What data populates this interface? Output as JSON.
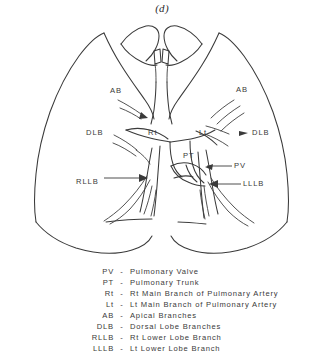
{
  "figure": {
    "caption": "(d)"
  },
  "diagram_labels": [
    {
      "id": "ab-left",
      "text": "AB",
      "x": 110,
      "y": 87
    },
    {
      "id": "ab-right",
      "text": "AB",
      "x": 236,
      "y": 86
    },
    {
      "id": "dlb-left",
      "text": "DLB",
      "x": 86,
      "y": 129
    },
    {
      "id": "dlb-right",
      "text": "DLB",
      "x": 252,
      "y": 129
    },
    {
      "id": "rt",
      "text": "Rt",
      "x": 148,
      "y": 129
    },
    {
      "id": "lt",
      "text": "Lt",
      "x": 199,
      "y": 129
    },
    {
      "id": "pt",
      "text": "PT",
      "x": 183,
      "y": 152
    },
    {
      "id": "pv",
      "text": "PV",
      "x": 234,
      "y": 162
    },
    {
      "id": "rllb",
      "text": "RLLB",
      "x": 76,
      "y": 178
    },
    {
      "id": "lllb",
      "text": "LLLB",
      "x": 243,
      "y": 180
    }
  ],
  "legend": {
    "dash": "-",
    "entries": [
      {
        "abbr": "PV",
        "desc": "Pulmonary Valve"
      },
      {
        "abbr": "PT",
        "desc": "Pulmonary Trunk"
      },
      {
        "abbr": "Rt",
        "desc": "Rt Main Branch of Pulmonary Artery"
      },
      {
        "abbr": "Lt",
        "desc": "Lt Main Branch of Pulmonary Artery"
      },
      {
        "abbr": "AB",
        "desc": "Apical Branches"
      },
      {
        "abbr": "DLB",
        "desc": "Dorsal Lobe Branches"
      },
      {
        "abbr": "RLLB",
        "desc": "Rt Lower Lobe Branch"
      },
      {
        "abbr": "LLLB",
        "desc": "Lt Lower Lobe Branch"
      }
    ]
  },
  "style": {
    "ink_color": "#3a3a3a",
    "background": "#ffffff"
  }
}
